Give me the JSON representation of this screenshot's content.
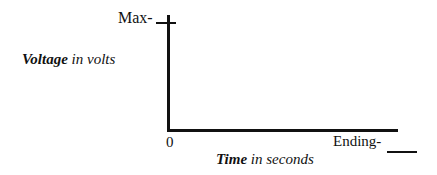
{
  "chart_data": {
    "type": "line",
    "title": "",
    "xlabel": "Time in seconds",
    "xlabel_bold_part": "Time",
    "xlabel_rest": " in seconds",
    "ylabel": "Voltage in volts",
    "ylabel_bold_part": "Voltage",
    "ylabel_rest": " in volts",
    "x_ticks": [
      "0",
      "Ending-"
    ],
    "y_ticks": [
      "Max-"
    ],
    "series": [],
    "grid": false,
    "legend": null
  },
  "labels": {
    "y_max": "Max-",
    "x_origin": "0",
    "x_end": "Ending-"
  }
}
